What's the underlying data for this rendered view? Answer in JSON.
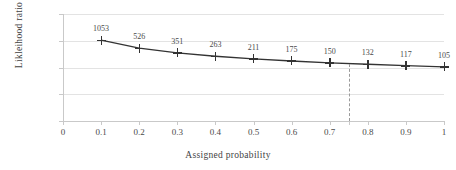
{
  "clipped_title": "",
  "chart_data": {
    "type": "line",
    "title": "",
    "xlabel": "Assigned probability",
    "ylabel": "Likleihood ratio",
    "yscale": "log",
    "ylim": [
      1,
      10000
    ],
    "xlim": [
      0,
      1
    ],
    "grid": true,
    "legend": "none",
    "x": [
      0.1,
      0.2,
      0.3,
      0.4,
      0.5,
      0.6,
      0.7,
      0.8,
      0.9,
      1.0
    ],
    "values": [
      1053,
      526,
      351,
      263,
      211,
      175,
      150,
      132,
      117,
      105
    ],
    "point_labels": [
      "1053",
      "526",
      "351",
      "263",
      "211",
      "175",
      "150",
      "132",
      "117",
      "105"
    ],
    "xticks": [
      "0",
      "0.1",
      "0.2",
      "0.3",
      "0.4",
      "0.5",
      "0.6",
      "0.7",
      "0.8",
      "0.9",
      "1"
    ],
    "xtick_values": [
      0,
      0.1,
      0.2,
      0.3,
      0.4,
      0.5,
      0.6,
      0.7,
      0.8,
      0.9,
      1.0
    ],
    "extra_xticks": [
      0.75
    ],
    "yticks": [
      "1",
      "10",
      "100",
      "1000",
      "10000"
    ],
    "ytick_values": [
      1,
      10,
      100,
      1000,
      10000
    ],
    "annotations": [
      {
        "type": "vertical-dashed-line",
        "x": 0.75,
        "label": ""
      }
    ],
    "marker": "plus",
    "series_color": "#333333",
    "grid_color": "#e3e3e3"
  }
}
